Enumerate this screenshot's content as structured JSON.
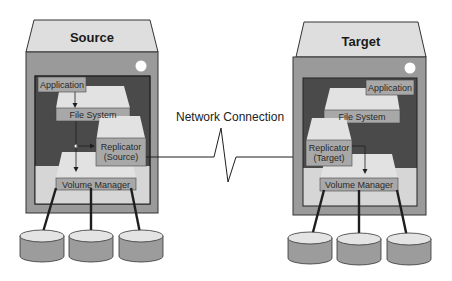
{
  "source": {
    "title": "Source",
    "layers": {
      "application": "Application",
      "file_system": "File System",
      "replicator": [
        "Replicator",
        "(Source)"
      ],
      "volume_manager": "Volume Manager"
    },
    "disk_count": 3
  },
  "target": {
    "title": "Target",
    "layers": {
      "application": "Application",
      "file_system": "File System",
      "replicator": [
        "Replicator",
        "(Target)"
      ],
      "volume_manager": "Volume Manager"
    },
    "disk_count": 3
  },
  "link": {
    "label": "Network Connection"
  },
  "colors": {
    "roof": "#dedede",
    "body": "#9a9a9a",
    "inner_dark": "#4a4a4a",
    "inner_light": "#d6d6d6",
    "layer_top": "#e2e2e2",
    "layer_label": "#a8a8a8",
    "disk_top": "#e4e4e4",
    "disk_side": "#9c9c9c",
    "line": "#1e1e1e"
  }
}
